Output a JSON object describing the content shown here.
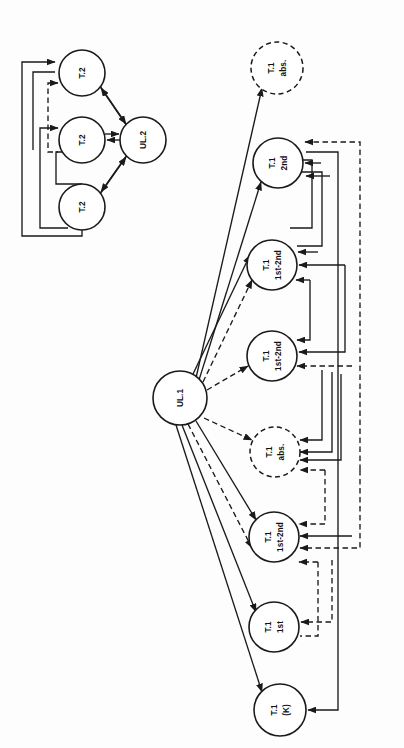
{
  "figure": {
    "background_color": "#fdfdfd",
    "stroke_color": "#1a1a1a",
    "orientation": "labels rotated 90 degrees counter-clockwise"
  },
  "clusters": [
    {
      "id": "cluster-ul2",
      "name": "UL.2 cluster",
      "hub": {
        "id": "ul2",
        "label": "UL.2",
        "line1": "UL.2",
        "line2": "",
        "cx": 143,
        "cy": 140,
        "r": 23,
        "style": "solid"
      },
      "nodes": [
        {
          "id": "t2-a",
          "label": "T.2",
          "line1": "T.2",
          "line2": "",
          "cx": 82,
          "cy": 73,
          "r": 23,
          "style": "solid"
        },
        {
          "id": "t2-b",
          "label": "T.2",
          "line1": "T.2",
          "line2": "",
          "cx": 82,
          "cy": 140,
          "r": 23,
          "style": "solid"
        },
        {
          "id": "t2-c",
          "label": "T.2",
          "line1": "T.2",
          "line2": "",
          "cx": 82,
          "cy": 207,
          "r": 23,
          "style": "solid"
        }
      ]
    },
    {
      "id": "cluster-ul1",
      "name": "UL.1 cluster",
      "hub": {
        "id": "ul1",
        "label": "UL.1",
        "line1": "UL.1",
        "line2": "",
        "cx": 180,
        "cy": 398,
        "r": 27,
        "style": "solid"
      },
      "nodes": [
        {
          "id": "t1-abs-top",
          "label": "T.1 abs.",
          "line1": "T.1",
          "line2": "abs.",
          "cx": 277,
          "cy": 68,
          "r": 26,
          "style": "dashed"
        },
        {
          "id": "t1-2nd",
          "label": "T.1 2nd",
          "line1": "T.1",
          "line2": "2nd",
          "cx": 278,
          "cy": 163,
          "r": 25,
          "style": "solid"
        },
        {
          "id": "t1-1st2nd-a",
          "label": "T.1 1st-2nd",
          "line1": "T.1",
          "line2": "1st-2nd",
          "cx": 272,
          "cy": 265,
          "r": 25,
          "style": "solid"
        },
        {
          "id": "t1-1st2nd-b",
          "label": "T.1 1st-2nd",
          "line1": "T.1",
          "line2": "1st-2nd",
          "cx": 272,
          "cy": 356,
          "r": 25,
          "style": "solid"
        },
        {
          "id": "t1-abs-mid",
          "label": "T.1 abs.",
          "line1": "T.1",
          "line2": "abs.",
          "cx": 275,
          "cy": 452,
          "r": 25,
          "style": "dashed"
        },
        {
          "id": "t1-1st2nd-c",
          "label": "T.1 1st-2nd",
          "line1": "T.1",
          "line2": "1st-2nd",
          "cx": 274,
          "cy": 537,
          "r": 25,
          "style": "solid"
        },
        {
          "id": "t1-1st",
          "label": "T.1 1st",
          "line1": "T.1",
          "line2": "1st",
          "cx": 274,
          "cy": 627,
          "r": 25,
          "style": "solid"
        },
        {
          "id": "t1-k",
          "label": "T.1 (K)",
          "line1": "T.1",
          "line2": "(K)",
          "cx": 280,
          "cy": 710,
          "r": 26,
          "style": "solid"
        }
      ]
    }
  ],
  "edges": {
    "ul2_cluster": [
      {
        "id": "e-ul2-t2a",
        "from": "ul2",
        "to": "t2-a",
        "style": "solid",
        "kind": "hub-out"
      },
      {
        "id": "e-t2a-ul2",
        "from": "t2-a",
        "to": "ul2",
        "style": "solid",
        "kind": "hub-in"
      },
      {
        "id": "e-ul2-t2b",
        "from": "ul2",
        "to": "t2-b",
        "style": "solid",
        "kind": "hub-out"
      },
      {
        "id": "e-t2b-ul2",
        "from": "t2-b",
        "to": "ul2",
        "style": "solid",
        "kind": "hub-in"
      },
      {
        "id": "e-ul2-t2c",
        "from": "ul2",
        "to": "t2-c",
        "style": "solid",
        "kind": "hub-out"
      },
      {
        "id": "e-t2c-ul2",
        "from": "t2-c",
        "to": "ul2",
        "style": "solid",
        "kind": "hub-in"
      },
      {
        "id": "fb-outer",
        "from": "t2-c",
        "to": "t2-a",
        "style": "solid",
        "kind": "feedback-loop"
      },
      {
        "id": "fb-mid",
        "from": "t2-c",
        "to": "t2-b",
        "style": "solid",
        "kind": "feedback-loop"
      },
      {
        "id": "fb-inner",
        "from": "t2-b",
        "to": "t2-a",
        "style": "dashed",
        "kind": "feedback-loop"
      }
    ],
    "ul1_cluster": [
      {
        "id": "e-ul1-abs-top",
        "from": "ul1",
        "to": "t1-abs-top",
        "style": "solid",
        "kind": "hub-out"
      },
      {
        "id": "e-ul1-2nd",
        "from": "ul1",
        "to": "t1-2nd",
        "style": "solid",
        "kind": "hub-out"
      },
      {
        "id": "e-2nd-ul1",
        "from": "t1-2nd",
        "to": "ul1",
        "style": "dashed",
        "kind": "hub-in"
      },
      {
        "id": "e-ul1-a",
        "from": "ul1",
        "to": "t1-1st2nd-a",
        "style": "solid",
        "kind": "hub-out"
      },
      {
        "id": "e-a-ul1",
        "from": "t1-1st2nd-a",
        "to": "ul1",
        "style": "dashed",
        "kind": "hub-in"
      },
      {
        "id": "e-ul1-b",
        "from": "ul1",
        "to": "t1-1st2nd-b",
        "style": "dashed",
        "kind": "hub-out"
      },
      {
        "id": "e-ul1-absmid",
        "from": "ul1",
        "to": "t1-abs-mid",
        "style": "dashed",
        "kind": "hub-out"
      },
      {
        "id": "e-ul1-c",
        "from": "ul1",
        "to": "t1-1st2nd-c",
        "style": "solid",
        "kind": "hub-out"
      },
      {
        "id": "e-c-ul1",
        "from": "t1-1st2nd-c",
        "to": "ul1",
        "style": "dashed",
        "kind": "hub-in"
      },
      {
        "id": "e-ul1-1st",
        "from": "ul1",
        "to": "t1-1st",
        "style": "solid",
        "kind": "hub-out"
      },
      {
        "id": "e-ul1-k",
        "from": "ul1",
        "to": "t1-k",
        "style": "solid",
        "kind": "hub-out"
      }
    ]
  },
  "counts": {
    "total_nodes": 12,
    "ul2_cluster_nodes": 4,
    "ul1_cluster_nodes": 9,
    "dashed_nodes": 2
  }
}
